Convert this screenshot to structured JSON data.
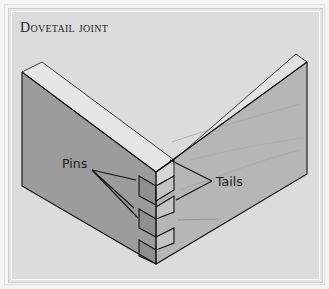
{
  "title": "Dovetail joint",
  "labels": {
    "pins": "Pins",
    "tails": "Tails"
  },
  "colors": {
    "frame_bg": "#dcdcdc",
    "board_top": "#e6e6e6",
    "left_face": "#9c9c9c",
    "right_face": "#b6b6b6",
    "pin_face": "#8f8f8f",
    "tail_face": "#c2c2c2",
    "line": "#111111"
  }
}
